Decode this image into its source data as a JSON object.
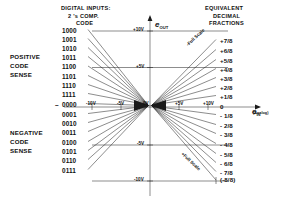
{
  "headers": {
    "digital_inputs_l1": "DIGITAL INPUTS:",
    "digital_inputs_l2": "2 's COMP.",
    "digital_inputs_l3": "CODE",
    "equivalent_l1": "EQUIVALENT",
    "equivalent_l2": "DECIMAL",
    "equivalent_l3": "FRACTIONS"
  },
  "sense_labels": {
    "positive": [
      "POSITIVE",
      "CODE",
      "SENSE"
    ],
    "negative": [
      "NEGATIVE",
      "CODE",
      "SENSE"
    ]
  },
  "axes": {
    "y_axis_name": "e",
    "y_axis_sub": "OUT",
    "x_axis_name": "e",
    "x_axis_sub": "IN",
    "x_axis_note": "(Analog)",
    "y_ticks": [
      "+10V",
      "+5V",
      "-5V",
      "-10V"
    ],
    "x_ticks": [
      "-10V",
      "-5V",
      "0V",
      "+5V",
      "+10V"
    ],
    "origin_label": "0"
  },
  "annotations": {
    "upper_full_scale": "-Full Scale",
    "lower_full_scale": "+Full Scale",
    "bottom_fraction": "(-8/8)"
  },
  "chart_data": {
    "type": "scatter",
    "xlabel": "e IN (Analog)",
    "ylabel": "e OUT",
    "xlim": [
      -10,
      10
    ],
    "ylim": [
      -10,
      10
    ],
    "grid": false,
    "legend": "none",
    "codes": [
      "1000",
      "1001",
      "1010",
      "1011",
      "1100",
      "1101",
      "1110",
      "1111",
      "0000",
      "0001",
      "0010",
      "0011",
      "0100",
      "0101",
      "0110",
      "0111"
    ],
    "fractions": [
      "+7/8",
      "+6/8",
      "+5/8",
      "+4/8",
      "+3/8",
      "+2/8",
      "+1/8",
      "0",
      "-1/8",
      "-2/8",
      "-3/8",
      "-4/8",
      "-5/8",
      "-6/8",
      "-7/8",
      "(-8/8)"
    ],
    "pairs": [
      {
        "code": "1000",
        "fraction": "+7/8",
        "volts": 8.75
      },
      {
        "code": "1001",
        "fraction": "+6/8",
        "volts": 7.5
      },
      {
        "code": "1010",
        "fraction": "+5/8",
        "volts": 6.25
      },
      {
        "code": "1011",
        "fraction": "+4/8",
        "volts": 5.0
      },
      {
        "code": "1100",
        "fraction": "+3/8",
        "volts": 3.75
      },
      {
        "code": "1101",
        "fraction": "+2/8",
        "volts": 2.5
      },
      {
        "code": "1110",
        "fraction": "+1/8",
        "volts": 1.25
      },
      {
        "code": "1111",
        "fraction": "0",
        "volts": 0.0
      },
      {
        "code": "0000",
        "fraction": "-1/8",
        "volts": -1.25
      },
      {
        "code": "0001",
        "fraction": "-2/8",
        "volts": -2.5
      },
      {
        "code": "0010",
        "fraction": "-3/8",
        "volts": -3.75
      },
      {
        "code": "0011",
        "fraction": "-4/8",
        "volts": -5.0
      },
      {
        "code": "0100",
        "fraction": "-5/8",
        "volts": -6.25
      },
      {
        "code": "0101",
        "fraction": "-6/8",
        "volts": -7.5
      },
      {
        "code": "0110",
        "fraction": "-7/8",
        "volts": -8.75
      },
      {
        "code": "0111",
        "fraction": "(-8/8)",
        "volts": -10.0
      }
    ]
  },
  "code_rows": [
    {
      "code": "1000",
      "y": 31
    },
    {
      "code": "1001",
      "y": 40
    },
    {
      "code": "1010",
      "y": 49
    },
    {
      "code": "1011",
      "y": 58
    },
    {
      "code": "1100",
      "y": 67.5
    },
    {
      "code": "1101",
      "y": 77
    },
    {
      "code": "1110",
      "y": 86
    },
    {
      "code": "1111",
      "y": 95
    },
    {
      "code": "0000",
      "y": 105
    },
    {
      "code": "0001",
      "y": 115
    },
    {
      "code": "0010",
      "y": 124
    },
    {
      "code": "0011",
      "y": 133
    },
    {
      "code": "0100",
      "y": 143
    },
    {
      "code": "0101",
      "y": 152
    },
    {
      "code": "0110",
      "y": 161
    },
    {
      "code": "0111",
      "y": 171
    }
  ],
  "fraction_rows": [
    {
      "fraction": "+7/8",
      "y": 41
    },
    {
      "fraction": "+6/8",
      "y": 51
    },
    {
      "fraction": "+5/8",
      "y": 61
    },
    {
      "fraction": "+4/8",
      "y": 70
    },
    {
      "fraction": "+3/8",
      "y": 79
    },
    {
      "fraction": "+2/8",
      "y": 88
    },
    {
      "fraction": "+1/8",
      "y": 97
    },
    {
      "fraction": "0",
      "y": 107
    },
    {
      "fraction": "- 1/8",
      "y": 116
    },
    {
      "fraction": "- 2/8",
      "y": 126
    },
    {
      "fraction": "- 3/8",
      "y": 135
    },
    {
      "fraction": "- 4/8",
      "y": 145
    },
    {
      "fraction": "- 5/8",
      "y": 155
    },
    {
      "fraction": "- 6/8",
      "y": 164
    },
    {
      "fraction": "- 7/8",
      "y": 173
    }
  ],
  "colors": {
    "line": "#1a1a1a",
    "text": "#111111",
    "background": "#ffffff"
  }
}
